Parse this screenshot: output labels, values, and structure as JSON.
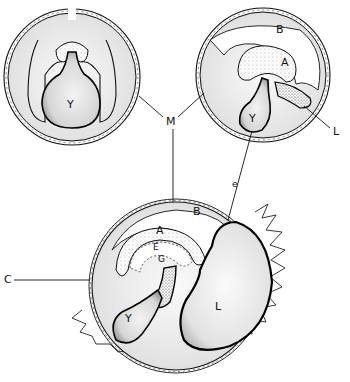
{
  "figure": {
    "stages": [
      {
        "id": "stage-1",
        "position": "top-left",
        "labels": [
          "Y"
        ]
      },
      {
        "id": "stage-2",
        "position": "top-right",
        "labels": [
          "B",
          "A",
          "Y",
          "L"
        ]
      },
      {
        "id": "stage-3",
        "position": "bottom-center",
        "labels": [
          "B",
          "A",
          "E",
          "G",
          "C",
          "Y",
          "L"
        ]
      }
    ],
    "labels": {
      "M": "M",
      "Y": "Y",
      "B": "B",
      "A": "A",
      "L": "L",
      "e": "e",
      "C": "C",
      "E": "E",
      "G": "G"
    }
  }
}
